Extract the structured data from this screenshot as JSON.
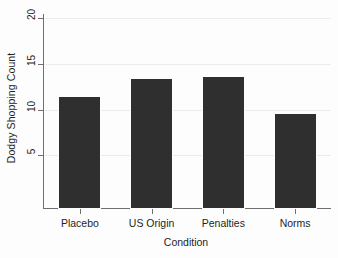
{
  "chart_data": {
    "type": "bar",
    "title": "",
    "categories": [
      "Placebo",
      "US Origin",
      "Penalties",
      "Norms"
    ],
    "values": [
      11.4,
      13.3,
      13.5,
      9.5
    ],
    "xlabel": "Condition",
    "ylabel": "Dodgy Shopping Count",
    "ylim": [
      0,
      20
    ],
    "yticks": [
      5,
      10,
      15,
      20
    ],
    "ytick_labels": [
      "5",
      "10",
      "15",
      "20"
    ],
    "grid": true,
    "grid_axis": "y",
    "legend": "none",
    "bar_color": "#2f2f2f",
    "grid_color": "#ececed",
    "axis_color": "#6f6f6f",
    "background": "#fdfdfd"
  }
}
